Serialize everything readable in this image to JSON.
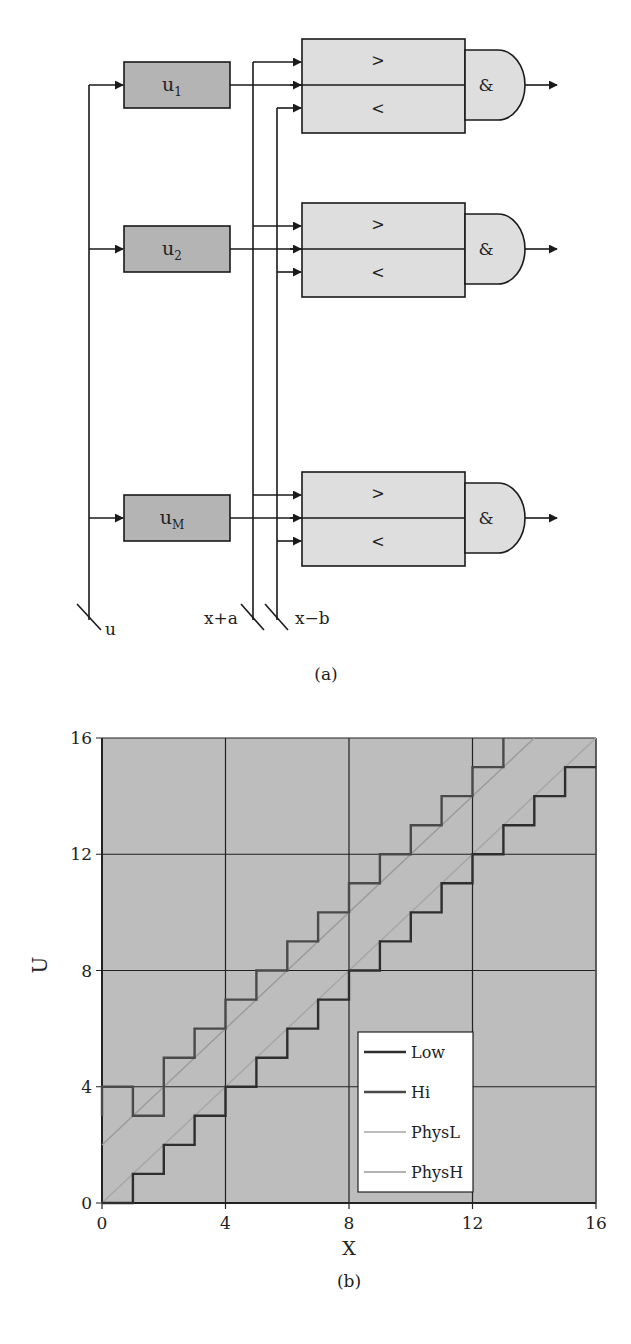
{
  "panel_a": {
    "caption": "(a)",
    "blocks": [
      {
        "label": "u",
        "sub": "1",
        "y": 85
      },
      {
        "label": "u",
        "sub": "2",
        "y": 249
      },
      {
        "label": "u",
        "sub": "M",
        "y": 518
      }
    ],
    "comparator": {
      "gt": ">",
      "lt": "<"
    },
    "and_label": "&",
    "bus_labels": {
      "u": "u",
      "xa": "x+a",
      "xb": "x−b"
    },
    "colors": {
      "block_fill": "#b4b4b4",
      "comparator_fill": "#dedede",
      "line": "#1a1a1a"
    }
  },
  "panel_b": {
    "caption": "(b)"
  },
  "chart_data": {
    "type": "line",
    "title": "",
    "xlabel": "X",
    "ylabel": "U",
    "xlim": [
      0,
      16
    ],
    "ylim": [
      0,
      16
    ],
    "xticks": [
      "0",
      "4",
      "8",
      "12",
      "16"
    ],
    "yticks": [
      "0",
      "4",
      "8",
      "12",
      "16"
    ],
    "grid": true,
    "grid_step": 4,
    "background": "#bdbdbd",
    "legend": {
      "position": "inside-right-lower",
      "entries": [
        "Low",
        "Hi",
        "PhysL",
        "PhysH"
      ]
    },
    "series": [
      {
        "name": "Low",
        "style": "step",
        "color": "#2e2e2e",
        "width": 2.4,
        "x": [
          0,
          1,
          1,
          2,
          2,
          3,
          3,
          4,
          4,
          5,
          5,
          6,
          6,
          7,
          7,
          8,
          8,
          9,
          9,
          10,
          10,
          11,
          11,
          12,
          12,
          13,
          13,
          14,
          14,
          15,
          15,
          16
        ],
        "y": [
          0,
          0,
          1,
          1,
          2,
          2,
          3,
          3,
          4,
          4,
          5,
          5,
          6,
          6,
          7,
          7,
          8,
          8,
          9,
          9,
          10,
          10,
          11,
          11,
          12,
          12,
          13,
          13,
          14,
          14,
          15,
          15
        ]
      },
      {
        "name": "Hi",
        "style": "step",
        "color": "#4a4a4a",
        "width": 2.4,
        "x": [
          0,
          0,
          1,
          1,
          2,
          2,
          3,
          3,
          4,
          4,
          5,
          5,
          6,
          6,
          7,
          7,
          8,
          8,
          9,
          9,
          10,
          10,
          11,
          11,
          12,
          12,
          13,
          13
        ],
        "y": [
          3,
          4,
          4,
          3,
          3,
          5,
          5,
          6,
          6,
          7,
          7,
          8,
          8,
          9,
          9,
          10,
          10,
          11,
          11,
          12,
          12,
          13,
          13,
          14,
          14,
          15,
          15,
          16
        ]
      },
      {
        "name": "PhysL",
        "style": "line",
        "color": "#a6a6a6",
        "width": 1.4,
        "x": [
          0,
          16
        ],
        "y": [
          0,
          16
        ]
      },
      {
        "name": "PhysH",
        "style": "line",
        "color": "#9a9a9a",
        "width": 1.4,
        "x": [
          0,
          14
        ],
        "y": [
          2,
          16
        ]
      }
    ]
  }
}
